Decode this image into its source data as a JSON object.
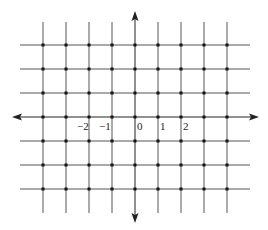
{
  "diagram": {
    "type": "coordinate-grid",
    "grid_color": "#555555",
    "axis_color": "#222222",
    "point_color": "#111111",
    "x_lines": [
      43,
      66,
      89,
      112,
      158,
      181,
      204,
      227
    ],
    "y_lines": [
      45,
      69,
      93,
      141,
      165,
      189
    ],
    "origin": {
      "x": 135,
      "y": 117
    },
    "grid_extent": {
      "x_min": 20,
      "x_max": 250,
      "y_min": 22,
      "y_max": 213
    },
    "axes": {
      "x_axis": {
        "from": 12,
        "to": 259
      },
      "y_axis": {
        "from": 11,
        "to": 223
      }
    },
    "tick_labels": [
      {
        "text": "−2",
        "x": 77,
        "y": 121
      },
      {
        "text": "−1",
        "x": 99,
        "y": 121
      },
      {
        "text": "0",
        "x": 137,
        "y": 121
      },
      {
        "text": "1",
        "x": 160,
        "y": 121
      },
      {
        "text": "2",
        "x": 183,
        "y": 121
      }
    ]
  },
  "labels": {
    "neg2": "−2",
    "neg1": "−1",
    "zero": "0",
    "one": "1",
    "two": "2"
  }
}
